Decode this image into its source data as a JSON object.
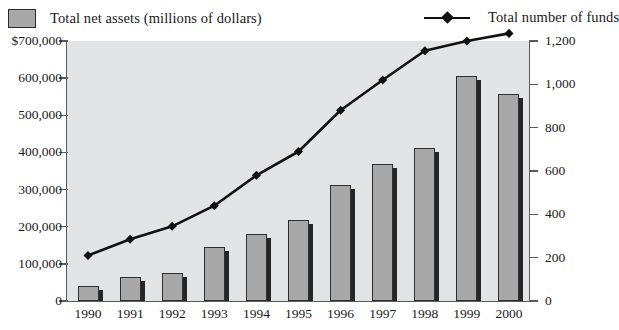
{
  "legend": {
    "bars": {
      "label": "Total net assets (millions of dollars)",
      "swatch_color": "#a8a8a8"
    },
    "line": {
      "label": "Total number of funds",
      "color": "#111111"
    }
  },
  "chart_data": {
    "type": "bar",
    "title": "",
    "xlabel": "",
    "ylabel": "",
    "grid": false,
    "legend_position": "top",
    "categories": [
      "1990",
      "1991",
      "1992",
      "1993",
      "1994",
      "1995",
      "1996",
      "1997",
      "1998",
      "1999",
      "2000"
    ],
    "axes": {
      "left": {
        "label": "Total net assets (millions of dollars)",
        "ylim": [
          0,
          700000
        ],
        "ticks": [
          0,
          100000,
          200000,
          300000,
          400000,
          500000,
          600000,
          700000
        ],
        "tick_labels": [
          "0",
          "100,000",
          "200,000",
          "300,000",
          "400,000",
          "500,000",
          "600,000",
          "$700,000"
        ]
      },
      "right": {
        "label": "Total number of funds",
        "ylim": [
          0,
          1200
        ],
        "ticks": [
          0,
          200,
          400,
          600,
          800,
          1000,
          1200
        ],
        "tick_labels": [
          "0",
          "200",
          "400",
          "600",
          "800",
          "1,000",
          "1,200"
        ]
      }
    },
    "series": [
      {
        "name": "Total net assets (millions of dollars)",
        "type": "bar",
        "axis": "left",
        "color": "#a8a8a8",
        "values": [
          40000,
          65000,
          75000,
          145000,
          180000,
          218000,
          312000,
          368000,
          412000,
          605000,
          558000
        ]
      },
      {
        "name": "Total number of funds",
        "type": "line",
        "axis": "right",
        "color": "#111111",
        "marker": "diamond",
        "values": [
          210,
          285,
          345,
          440,
          580,
          690,
          880,
          1020,
          1155,
          1200,
          1235
        ]
      }
    ]
  }
}
